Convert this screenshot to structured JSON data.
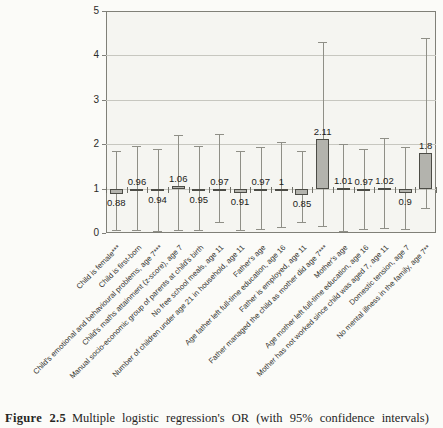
{
  "figure": {
    "caption_label": "Figure 2.5",
    "caption_text": "Multiple logistic regression's OR (with 95% confidence intervals)"
  },
  "chart_data": {
    "type": "bar",
    "title": "",
    "xlabel": "",
    "ylabel": "",
    "ylim": [
      0,
      5
    ],
    "yticks": [
      0,
      1,
      2,
      3,
      4,
      5
    ],
    "baseline": 1,
    "grid": true,
    "legend": "none",
    "bar_fill_color": "#b3b3ad",
    "bar_border_color": "#4c4c46",
    "error_bar_color": "#8f8f87",
    "categories": [
      "Child is female***",
      "Child is first-born",
      "Child's emotional and behavioural problems, age 7***",
      "Child's maths attainment (z-score), age 7",
      "Manual socio-economic group of parents at child's birth",
      "No free school meals, age 11",
      "Number of children under age 21 in household, age 11",
      "Father's age",
      "Age father left full-time education, age 16",
      "Father is employed, age 11",
      "Father managed the child as mother did age 7***",
      "Mother's age",
      "Age mother left full-time education, age 16",
      "Mother has not worked since child was aged 7, age 11",
      "Domestic tension, age 7",
      "No mental illness in the family, age 7**"
    ],
    "values": [
      0.88,
      0.96,
      0.94,
      1.06,
      0.95,
      0.97,
      0.91,
      0.97,
      1,
      0.85,
      2.11,
      1.01,
      0.97,
      1.02,
      0.9,
      1.8
    ],
    "value_labels": [
      "0.88",
      "0.96",
      "0.94",
      "1.06",
      "0.95",
      "0.97",
      "0.91",
      "0.97",
      "1",
      "0.85",
      "2.11",
      "1.01",
      "0.97",
      "1.02",
      "0.9",
      "1.8"
    ],
    "label_side": [
      "below",
      "above",
      "below",
      "above",
      "below",
      "above",
      "below",
      "above",
      "above",
      "below",
      "above",
      "above",
      "above",
      "above",
      "below",
      "above"
    ],
    "ci_low": [
      0.06,
      0.06,
      0.05,
      0.06,
      0.06,
      0.24,
      0.06,
      0.08,
      0.14,
      0.24,
      0.16,
      0.04,
      0.09,
      0.12,
      0.08,
      0.57
    ],
    "ci_high": [
      1.84,
      1.95,
      1.9,
      2.2,
      1.97,
      2.24,
      1.85,
      1.93,
      2.04,
      1.85,
      4.3,
      2.0,
      1.9,
      2.13,
      1.93,
      4.4
    ]
  }
}
